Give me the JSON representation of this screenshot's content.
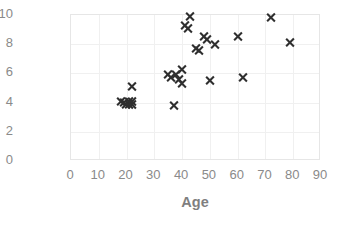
{
  "chart_data": {
    "type": "scatter",
    "title": "",
    "xlabel": "Age",
    "ylabel": "Preference",
    "xlim": [
      0,
      90
    ],
    "ylim": [
      0,
      10
    ],
    "xticks": [
      "0",
      "10",
      "20",
      "30",
      "40",
      "50",
      "60",
      "70",
      "80",
      "90"
    ],
    "yticks": [
      "0",
      "2",
      "4",
      "6",
      "8",
      "10"
    ],
    "xtick_values": [
      0,
      10,
      20,
      30,
      40,
      50,
      60,
      70,
      80,
      90
    ],
    "ytick_values": [
      0,
      2,
      4,
      6,
      8,
      10
    ],
    "grid": true,
    "legend": false,
    "marker": "x",
    "marker_color": "#2f2f2f",
    "points": [
      {
        "x": 18,
        "y": 4.1
      },
      {
        "x": 19,
        "y": 4.0
      },
      {
        "x": 20,
        "y": 3.9
      },
      {
        "x": 21,
        "y": 4.1
      },
      {
        "x": 21,
        "y": 3.9
      },
      {
        "x": 22,
        "y": 4.1
      },
      {
        "x": 22,
        "y": 3.9
      },
      {
        "x": 22,
        "y": 5.1
      },
      {
        "x": 35,
        "y": 5.9
      },
      {
        "x": 36,
        "y": 5.7
      },
      {
        "x": 37,
        "y": 3.8
      },
      {
        "x": 38,
        "y": 5.9
      },
      {
        "x": 39,
        "y": 5.6
      },
      {
        "x": 40,
        "y": 5.3
      },
      {
        "x": 40,
        "y": 6.3
      },
      {
        "x": 41,
        "y": 9.3
      },
      {
        "x": 42,
        "y": 9.1
      },
      {
        "x": 43,
        "y": 9.9
      },
      {
        "x": 45,
        "y": 7.7
      },
      {
        "x": 46,
        "y": 7.6
      },
      {
        "x": 48,
        "y": 8.5
      },
      {
        "x": 49,
        "y": 8.3
      },
      {
        "x": 50,
        "y": 5.5
      },
      {
        "x": 52,
        "y": 8.0
      },
      {
        "x": 60,
        "y": 8.5
      },
      {
        "x": 62,
        "y": 5.7
      },
      {
        "x": 72,
        "y": 9.8
      },
      {
        "x": 79,
        "y": 8.1
      }
    ]
  },
  "axis": {
    "x_title": "Age",
    "y_title": "Preference"
  }
}
